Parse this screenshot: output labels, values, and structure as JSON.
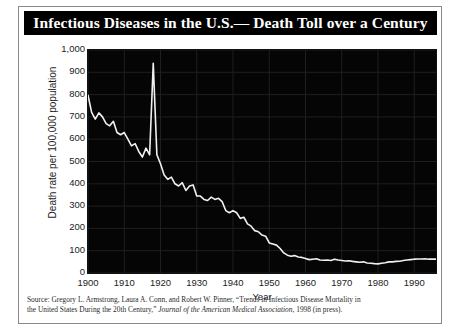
{
  "figure": {
    "title": "Infectious Diseases in the U.S.— Death Toll over a Century",
    "source_line_1": "Source:  Gregory L. Armstrong, Laura A. Conn, and Robert W. Pinner, “Trends in Infectious Disease Mortality in",
    "source_line_2_a": "the United States During the 20th Century,” ",
    "source_line_2_b": "Journal of the American Medical Association",
    "source_line_2_c": ", 1998 (in press)."
  },
  "colors": {
    "plot_background": "#050505",
    "line": "#f0f0f0",
    "grid": "#1f1f1f",
    "title_background": "#000000",
    "title_text": "#ffffff",
    "axis_text": "#1c1c1c",
    "frame_border": "#8a8a8a"
  },
  "chart_data": {
    "type": "line",
    "title": "Infectious Diseases in the U.S.— Death Toll over a Century",
    "xlabel": "Year",
    "ylabel": "Death rate per 100,000 population",
    "xlim": [
      1900,
      1996
    ],
    "ylim": [
      0,
      1000
    ],
    "xticks": [
      1900,
      1910,
      1920,
      1930,
      1940,
      1950,
      1960,
      1970,
      1980,
      1990
    ],
    "xtick_labels": [
      "1900",
      "1910",
      "1920",
      "1930",
      "1940",
      "1950",
      "1960",
      "1970",
      "1980",
      "1990"
    ],
    "yticks": [
      0,
      100,
      200,
      300,
      400,
      500,
      600,
      700,
      800,
      900,
      1000
    ],
    "ytick_labels": [
      "0",
      "100",
      "200",
      "300",
      "400",
      "500",
      "600",
      "700",
      "800",
      "900",
      "1,000"
    ],
    "grid": true,
    "legend": false,
    "series": [
      {
        "name": "Infectious disease mortality rate",
        "x": [
          1900,
          1901,
          1902,
          1903,
          1904,
          1905,
          1906,
          1907,
          1908,
          1909,
          1910,
          1911,
          1912,
          1913,
          1914,
          1915,
          1916,
          1917,
          1918,
          1919,
          1920,
          1921,
          1922,
          1923,
          1924,
          1925,
          1926,
          1927,
          1928,
          1929,
          1930,
          1931,
          1932,
          1933,
          1934,
          1935,
          1936,
          1937,
          1938,
          1939,
          1940,
          1941,
          1942,
          1943,
          1944,
          1945,
          1946,
          1947,
          1948,
          1949,
          1950,
          1951,
          1952,
          1953,
          1954,
          1955,
          1956,
          1957,
          1958,
          1959,
          1960,
          1961,
          1962,
          1963,
          1964,
          1965,
          1966,
          1967,
          1968,
          1969,
          1970,
          1971,
          1972,
          1973,
          1974,
          1975,
          1976,
          1977,
          1978,
          1979,
          1980,
          1981,
          1982,
          1983,
          1984,
          1985,
          1986,
          1987,
          1988,
          1989,
          1990,
          1991,
          1992,
          1993,
          1994,
          1995,
          1996
        ],
        "y": [
          797,
          720,
          690,
          718,
          700,
          670,
          660,
          680,
          630,
          620,
          630,
          600,
          570,
          580,
          545,
          520,
          560,
          530,
          940,
          530,
          490,
          440,
          420,
          430,
          400,
          390,
          405,
          370,
          390,
          395,
          345,
          345,
          330,
          325,
          340,
          330,
          335,
          320,
          280,
          270,
          280,
          270,
          245,
          250,
          220,
          210,
          190,
          185,
          170,
          165,
          135,
          130,
          125,
          110,
          90,
          80,
          75,
          78,
          72,
          70,
          65,
          60,
          62,
          64,
          58,
          57,
          58,
          56,
          62,
          58,
          56,
          54,
          55,
          52,
          50,
          48,
          50,
          45,
          44,
          42,
          41,
          44,
          46,
          50,
          50,
          52,
          53,
          56,
          58,
          60,
          62,
          63,
          63,
          64,
          62,
          62,
          62
        ]
      }
    ],
    "annotations": [
      {
        "label": "1918 influenza pandemic spike",
        "x": 1918,
        "y": 940
      }
    ]
  }
}
